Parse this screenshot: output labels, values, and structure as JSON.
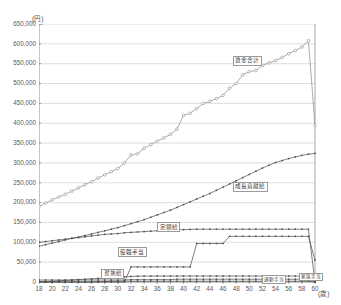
{
  "chart_data": {
    "type": "line",
    "title": "",
    "xlabel": "歳",
    "ylabel": "円",
    "y_unit_label": "(円)",
    "x_unit_label": "(歳)",
    "xlim": [
      18,
      60
    ],
    "ylim": [
      0,
      650000
    ],
    "grid": true,
    "legend_position": "inline-callout",
    "ytick_labels": [
      "0",
      "50,000",
      "100,000",
      "150,000",
      "200,000",
      "250,000",
      "300,000",
      "350,000",
      "400,000",
      "450,000",
      "500,000",
      "550,000",
      "600,000",
      "650,000"
    ],
    "ytick_values": [
      0,
      50000,
      100000,
      150000,
      200000,
      250000,
      300000,
      350000,
      400000,
      450000,
      500000,
      550000,
      600000,
      650000
    ],
    "xtick_labels": [
      "18",
      "20",
      "22",
      "24",
      "26",
      "28",
      "30",
      "32",
      "34",
      "36",
      "38",
      "40",
      "42",
      "44",
      "46",
      "48",
      "50",
      "52",
      "54",
      "56",
      "58",
      "60"
    ],
    "xtick_values": [
      18,
      20,
      22,
      24,
      26,
      28,
      30,
      32,
      34,
      36,
      38,
      40,
      42,
      44,
      46,
      48,
      50,
      52,
      54,
      56,
      58,
      60
    ],
    "x": [
      18,
      19,
      20,
      21,
      22,
      23,
      24,
      25,
      26,
      27,
      28,
      29,
      30,
      31,
      32,
      33,
      34,
      35,
      36,
      37,
      38,
      39,
      40,
      41,
      42,
      43,
      44,
      45,
      46,
      47,
      48,
      49,
      50,
      51,
      52,
      53,
      54,
      55,
      56,
      57,
      58,
      59,
      60
    ],
    "series": [
      {
        "name": "賃金合計",
        "label": "賃金合計",
        "marker": "circle-open",
        "values": [
          190000,
          199000,
          207000,
          214000,
          221000,
          229000,
          237000,
          245000,
          253000,
          262000,
          270000,
          278000,
          286000,
          300000,
          320000,
          323000,
          337000,
          346000,
          355000,
          363000,
          372000,
          385000,
          420000,
          425000,
          437000,
          450000,
          455000,
          462000,
          470000,
          488000,
          500000,
          522000,
          530000,
          533000,
          545000,
          552000,
          558000,
          566000,
          575000,
          583000,
          592000,
          608000,
          395000
        ]
      },
      {
        "name": "成長貢献給",
        "label": "成長貢献給",
        "marker": "dot",
        "values": [
          90000,
          94000,
          98000,
          102000,
          106000,
          110000,
          113000,
          117000,
          121000,
          125000,
          129000,
          133000,
          137000,
          142000,
          147000,
          152000,
          157000,
          163000,
          169000,
          175000,
          181000,
          188000,
          195000,
          202000,
          209000,
          216000,
          223000,
          231000,
          239000,
          247000,
          255000,
          263000,
          271000,
          279000,
          287000,
          294000,
          301000,
          306000,
          311000,
          315000,
          319000,
          322000,
          324000
        ]
      },
      {
        "name": "定額給",
        "label": "定額給",
        "marker": "dot",
        "values": [
          100000,
          102000,
          104000,
          106000,
          108000,
          110000,
          112000,
          114000,
          116000,
          118000,
          120000,
          121000,
          122000,
          124000,
          125000,
          126000,
          127000,
          128000,
          129000,
          130000,
          131000,
          131500,
          132000,
          132500,
          133000,
          133000,
          133000,
          133000,
          133000,
          133000,
          133000,
          133000,
          133000,
          133000,
          133000,
          133000,
          133000,
          133000,
          133000,
          133000,
          133000,
          133000,
          0
        ]
      },
      {
        "name": "役職手当",
        "label": "役職手当",
        "marker": "dot",
        "values": [
          0,
          0,
          0,
          0,
          0,
          0,
          0,
          0,
          0,
          0,
          0,
          0,
          0,
          0,
          38000,
          38000,
          38000,
          38000,
          38000,
          38000,
          38000,
          38000,
          38000,
          38000,
          97000,
          97000,
          97000,
          97000,
          97000,
          115000,
          115000,
          115000,
          115000,
          115000,
          115000,
          115000,
          115000,
          115000,
          115000,
          115000,
          115000,
          115000,
          55000
        ]
      },
      {
        "name": "習熟給",
        "label": "習熟給",
        "marker": "dot",
        "values": [
          0,
          1000,
          2000,
          3000,
          4000,
          5000,
          6000,
          7000,
          8000,
          9000,
          10000,
          11000,
          12000,
          13000,
          14000,
          14500,
          15000,
          15000,
          15000,
          15000,
          15000,
          15000,
          15000,
          15000,
          15000,
          15000,
          15000,
          15000,
          15000,
          15000,
          15000,
          15000,
          15000,
          15000,
          15000,
          15000,
          15000,
          15000,
          15000,
          15000,
          15000,
          15000,
          0
        ]
      },
      {
        "name": "通勤手当",
        "label": "通勤手当",
        "marker": "dot",
        "values": [
          5000,
          5000,
          5000,
          5000,
          5000,
          5000,
          5000,
          5000,
          5000,
          5000,
          5000,
          5000,
          5000,
          5000,
          6000,
          6000,
          6000,
          6000,
          6000,
          6000,
          6000,
          7000,
          7000,
          7000,
          7000,
          7000,
          7000,
          7000,
          7000,
          7000,
          7000,
          7000,
          7000,
          7000,
          7000,
          7000,
          7000,
          7000,
          7000,
          7000,
          7000,
          7000,
          7000
        ]
      },
      {
        "name": "家族手当",
        "label": "家族手当",
        "marker": "dot",
        "values": [
          0,
          0,
          0,
          0,
          0,
          0,
          0,
          0,
          0,
          1000,
          1000,
          2000,
          2000,
          2000,
          2000,
          2000,
          2000,
          2000,
          2000,
          2000,
          2000,
          2000,
          2000,
          2000,
          2000,
          2000,
          2000,
          2000,
          2000,
          2000,
          2000,
          2000,
          2000,
          2000,
          2000,
          2000,
          2000,
          2000,
          2000,
          2000,
          2000,
          2000,
          0
        ]
      }
    ],
    "annotations": [
      {
        "text": "賃金合計",
        "x": 47.5,
        "y": 560000
      },
      {
        "text": "成長貢献給",
        "x": 47.5,
        "y": 243000
      },
      {
        "text": "定額給",
        "x": 36.0,
        "y": 140000
      },
      {
        "text": "役職手当",
        "x": 30.0,
        "y": 78000
      },
      {
        "text": "習熟給",
        "x": 27.5,
        "y": 23000
      },
      {
        "text": "通勤手当",
        "x": 52.0,
        "y": 7000
      },
      {
        "text": "家族手当",
        "x": 57.5,
        "y": 13000
      }
    ],
    "colors": {
      "axis": "#6e6e6e",
      "grid": "#c8c8c8",
      "total_line": "#8a8a8a",
      "series_line": "#4a4a4a",
      "label_border": "#9a9a9a",
      "tick_text": "#5a5a5a"
    }
  }
}
